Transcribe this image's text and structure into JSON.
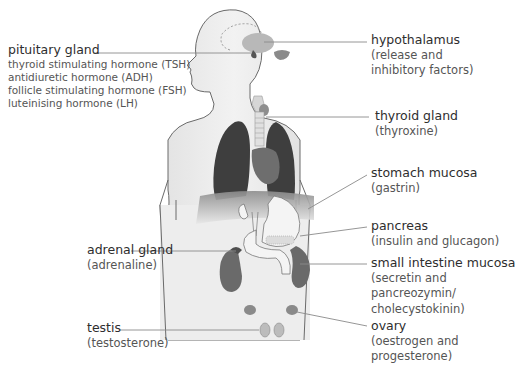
{
  "diagram": {
    "type": "anatomical endocrine system diagram",
    "colors": {
      "body_fill": "#ececec",
      "outline": "#6a6a6a",
      "lungs": "#3e3e3e",
      "heart": "#6e6e6e",
      "organ_mid": "#7a7a7a",
      "leader_line": "#8a8a8a",
      "text": "#3a3a3a"
    },
    "labels": {
      "pituitary": {
        "title": "pituitary gland",
        "lines": [
          "thyroid stimulating hormone (TSH)",
          "antidiuretic hormone (ADH)",
          "follicle stimulating hormone (FSH)",
          "luteinising hormone (LH)"
        ]
      },
      "hypothalamus": {
        "title": "hypothalamus",
        "lines": [
          "(release and",
          "inhibitory factors)"
        ]
      },
      "thyroid": {
        "title": "thyroid gland",
        "lines": [
          "(thyroxine)"
        ]
      },
      "stomach": {
        "title": "stomach mucosa",
        "lines": [
          "(gastrin)"
        ]
      },
      "pancreas": {
        "title": "pancreas",
        "lines": [
          "(insulin and glucagon)"
        ]
      },
      "adrenal": {
        "title": "adrenal gland",
        "lines": [
          "(adrenaline)"
        ]
      },
      "small_intestine": {
        "title": "small intestine mucosa",
        "lines": [
          "(secretin and",
          "pancreozymin/",
          "cholecystokinin)"
        ]
      },
      "testis": {
        "title": "testis",
        "lines": [
          "(testosterone)"
        ]
      },
      "ovary": {
        "title": "ovary",
        "lines": [
          "(oestrogen and",
          "progesterone)"
        ]
      }
    }
  }
}
